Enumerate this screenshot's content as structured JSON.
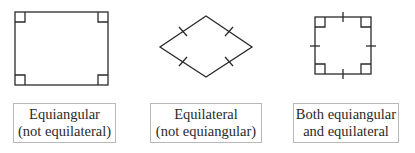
{
  "figures": [
    {
      "shape": "rectangle",
      "marks": "right-angle-marks",
      "label_line1": "Equiangular",
      "label_line2": "(not equilateral)"
    },
    {
      "shape": "rhombus",
      "marks": "tick-marks",
      "label_line1": "Equilateral",
      "label_line2": "(not equiangular)"
    },
    {
      "shape": "square",
      "marks": "right-angle-and-tick-marks",
      "label_line1": "Both equiangular",
      "label_line2": "and equilateral"
    }
  ],
  "colors": {
    "stroke": "#2a2a2a",
    "box_border": "#b8b8b8",
    "background": "#ffffff"
  }
}
